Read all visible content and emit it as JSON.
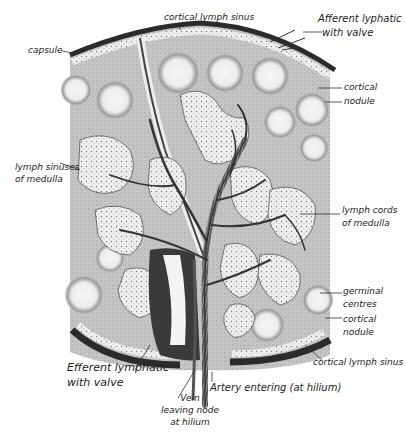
{
  "diagram": {
    "labels": {
      "cortical_lymph_sinus_top": "cortical lymph sinus",
      "afferent_1": "Afferent lyphatic",
      "afferent_2": "with valve",
      "capsule": "capsule",
      "cortical_nodule_top_1": "cortical",
      "cortical_nodule_top_2": "nodule",
      "lymph_sinuses_1": "lymph sinuses",
      "lymph_sinuses_2": "of medulla",
      "lymph_cords_1": "lymph cords",
      "lymph_cords_2": "of medulla",
      "germinal_1": "germinal",
      "germinal_2": "centres",
      "cortical_nodule_bottom_1": "cortical",
      "cortical_nodule_bottom_2": "nodule",
      "cortical_lymph_sinus_bottom": "cortical lymph sinus",
      "efferent_1": "Efferent lymphatic",
      "efferent_2": "with valve",
      "vein_1": "Vein",
      "vein_2": "leaving node",
      "vein_3": "at hilium",
      "artery": "Artery entering (at hilium)"
    },
    "colors": {
      "ink": "#222222",
      "tissue": "#c9c9c9",
      "nodule": "#f2f2f2",
      "sinus": "#ececec",
      "capsule": "#333333"
    }
  }
}
